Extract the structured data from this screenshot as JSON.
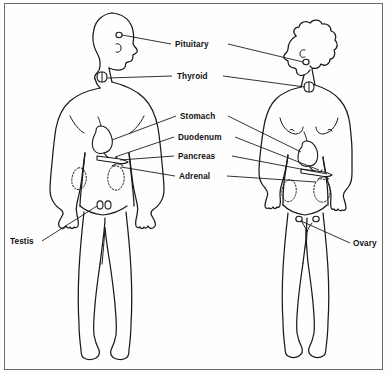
{
  "figure": {
    "background_color": "#fefefe",
    "ink_color": "#1a1a1a",
    "border_color": "#6b6b6b"
  },
  "subjects": [
    {
      "id": "male",
      "name": "male-figure",
      "facing": "right",
      "side": "left"
    },
    {
      "id": "female",
      "name": "female-figure",
      "facing": "left",
      "side": "right"
    }
  ],
  "labels": {
    "pituitary": "Pituitary",
    "thyroid": "Thyroid",
    "stomach": "Stomach",
    "duodenum": "Duodenum",
    "pancreas": "Pancreas",
    "adrenal": "Adrenal",
    "testis": "Testis",
    "ovary": "Ovary"
  },
  "annotations": [
    {
      "label": "Pituitary",
      "position": "center-top",
      "points_to": [
        "male-head",
        "female-head"
      ]
    },
    {
      "label": "Thyroid",
      "position": "center-top",
      "points_to": [
        "male-neck",
        "female-neck"
      ]
    },
    {
      "label": "Stomach",
      "position": "center-middle",
      "points_to": [
        "male-abdomen",
        "female-abdomen"
      ]
    },
    {
      "label": "Duodenum",
      "position": "center-middle",
      "points_to": [
        "male-abdomen",
        "female-abdomen"
      ]
    },
    {
      "label": "Pancreas",
      "position": "center-middle",
      "points_to": [
        "male-abdomen",
        "female-abdomen"
      ]
    },
    {
      "label": "Adrenal",
      "position": "center-middle",
      "points_to": [
        "male-abdomen",
        "female-abdomen"
      ]
    },
    {
      "label": "Testis",
      "position": "bottom-left",
      "points_to": [
        "male-groin"
      ]
    },
    {
      "label": "Ovary",
      "position": "bottom-right",
      "points_to": [
        "female-pelvis"
      ]
    }
  ]
}
